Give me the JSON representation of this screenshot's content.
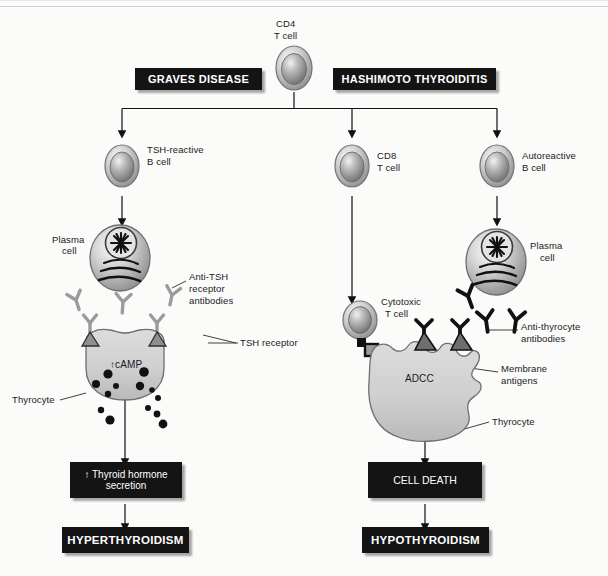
{
  "figure": {
    "type": "flow-diagram",
    "colors": {
      "box_fill": "#141414",
      "box_text": "#ffffff",
      "cell_outline": "#6e6e6e",
      "cell_fill_light": "#e6e6e6",
      "cell_fill_mid": "#c2c2c2",
      "antibody_light": "#9a9a9a",
      "antibody_dark": "#111111",
      "receptor_fill": "#8c8c8c",
      "granule": "#111111",
      "arrow": "#111111",
      "background": "#fbfbfa"
    }
  },
  "disease_boxes": [
    {
      "id": "graves",
      "label": "GRAVES DISEASE"
    },
    {
      "id": "hashimoto",
      "label": "HASHIMOTO THYROIDITIS"
    }
  ],
  "source_cell": {
    "name": "cd4-t-cell",
    "label_line1": "CD4",
    "label_line2": "T cell"
  },
  "branches": [
    {
      "id": "graves-branch",
      "disease": "GRAVES DISEASE",
      "cells": [
        {
          "name": "tsh-reactive-b-cell",
          "label_line1": "TSH-reactive",
          "label_line2": "B cell"
        },
        {
          "name": "plasma-cell-left",
          "label_line1": "Plasma",
          "label_line2": "cell"
        }
      ],
      "annotations": [
        {
          "name": "anti-tsh-receptor-antibodies",
          "lines": [
            "Anti-TSH",
            "receptor",
            "antibodies"
          ]
        },
        {
          "name": "tsh-receptor",
          "lines": [
            "TSH receptor"
          ]
        },
        {
          "name": "thyrocyte-left",
          "lines": [
            "Thyrocyte"
          ]
        },
        {
          "name": "camp",
          "lines": [
            "↑cAMP"
          ]
        }
      ],
      "outcome_boxes": [
        {
          "name": "thyroid-hormone-secretion-box",
          "lines": [
            "↑ Thyroid hormone",
            "secretion"
          ],
          "bold": false
        },
        {
          "name": "hyperthyroidism-box",
          "lines": [
            "HYPERTHYROIDISM"
          ],
          "bold": true
        }
      ]
    },
    {
      "id": "hashimoto-branch",
      "disease": "HASHIMOTO THYROIDITIS",
      "cells": [
        {
          "name": "cd8-t-cell",
          "label_line1": "CD8",
          "label_line2": "T cell"
        },
        {
          "name": "autoreactive-b-cell",
          "label_line1": "Autoreactive",
          "label_line2": "B cell"
        },
        {
          "name": "plasma-cell-right",
          "label_line1": "Plasma",
          "label_line2": "cell"
        },
        {
          "name": "cytotoxic-t-cell",
          "label_line1": "Cytotoxic",
          "label_line2": "T cell"
        }
      ],
      "annotations": [
        {
          "name": "anti-thyrocyte-antibodies",
          "lines": [
            "Anti-thyrocyte",
            "antibodies"
          ]
        },
        {
          "name": "membrane-antigens",
          "lines": [
            "Membrane",
            "antigens"
          ]
        },
        {
          "name": "thyrocyte-right",
          "lines": [
            "Thyrocyte"
          ]
        },
        {
          "name": "adcc",
          "lines": [
            "ADCC"
          ]
        }
      ],
      "outcome_boxes": [
        {
          "name": "cell-death-box",
          "lines": [
            "CELL DEATH"
          ],
          "bold": false
        },
        {
          "name": "hypothyroidism-box",
          "lines": [
            "HYPOTHYROIDISM"
          ],
          "bold": true
        }
      ]
    }
  ],
  "labels": {
    "cd4_l1": "CD4",
    "cd4_l2": "T cell",
    "graves": "GRAVES DISEASE",
    "hashimoto": "HASHIMOTO THYROIDITIS",
    "tsh_b_l1": "TSH-reactive",
    "tsh_b_l2": "B cell",
    "cd8_l1": "CD8",
    "cd8_l2": "T cell",
    "auto_b_l1": "Autoreactive",
    "auto_b_l2": "B cell",
    "plasma_l_l1": "Plasma",
    "plasma_l_l2": "cell",
    "plasma_r_l1": "Plasma",
    "plasma_r_l2": "cell",
    "antitsh_l1": "Anti-TSH",
    "antitsh_l2": "receptor",
    "antitsh_l3": "antibodies",
    "tsh_receptor": "TSH receptor",
    "thyrocyte_left": "Thyrocyte",
    "camp": "↑cAMP",
    "cytotoxic_l1": "Cytotoxic",
    "cytotoxic_l2": "T cell",
    "antithy_l1": "Anti-thyrocyte",
    "antithy_l2": "antibodies",
    "membrane_l1": "Membrane",
    "membrane_l2": "antigens",
    "thyrocyte_right": "Thyrocyte",
    "adcc": "ADCC",
    "hormone_l1": "↑ Thyroid hormone",
    "hormone_l2": "secretion",
    "hyper": "HYPERTHYROIDISM",
    "cell_death": "CELL DEATH",
    "hypo": "HYPOTHYROIDISM"
  }
}
